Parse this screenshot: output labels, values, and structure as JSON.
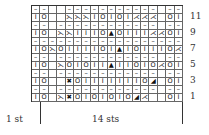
{
  "chart": {
    "columns": 18,
    "rows": [
      {
        "num": "12",
        "cells": [
          "–",
          "–",
          "",
          "",
          "–",
          "–",
          "–",
          "–",
          "–",
          "–",
          "–",
          "–",
          "–",
          "–",
          "–",
          "",
          "–",
          "–"
        ]
      },
      {
        "num": "11",
        "cells": [
          "I",
          "O",
          "",
          "",
          "⋋",
          "⋋",
          "⋋",
          "I",
          "O",
          "I",
          "O",
          "I",
          "⋌",
          "⋌",
          "⋌",
          "",
          "O",
          "I"
        ]
      },
      {
        "num": "10",
        "cells": [
          "–",
          "–",
          "",
          "–",
          "–",
          "–",
          "–",
          "–",
          "–",
          "–",
          "–",
          "–",
          "–",
          "–",
          "–",
          "",
          "–",
          "–"
        ]
      },
      {
        "num": "9",
        "cells": [
          "I",
          "O",
          "",
          "⋋",
          "⋋",
          "I",
          "I",
          "I",
          "O",
          "▲",
          "O",
          "I",
          "I",
          "I",
          "⋌",
          "⋌",
          "O",
          "I"
        ]
      },
      {
        "num": "8",
        "cells": [
          "–",
          "–",
          "–",
          "–",
          "–",
          "–",
          "–",
          "–",
          "–",
          "–",
          "–",
          "–",
          "–",
          "–",
          "–",
          "–",
          "–",
          "–"
        ]
      },
      {
        "num": "7",
        "cells": [
          "I",
          "O",
          "⋋",
          "O",
          "I",
          "I",
          "I",
          "I",
          "O",
          "I",
          "▲",
          "I",
          "O",
          "I",
          "I",
          "I",
          "O",
          "⋌"
        ]
      },
      {
        "num": "6",
        "cells": [
          "–",
          "–",
          "",
          "–",
          "–",
          "–",
          "–",
          "–",
          "–",
          "–",
          "–",
          "–",
          "–",
          "–",
          "–",
          "",
          "–",
          "–"
        ]
      },
      {
        "num": "5",
        "cells": [
          "I",
          "O",
          "",
          "⋋",
          "O",
          "I",
          "O",
          "I",
          "I",
          "▲",
          "I",
          "I",
          "O",
          "I",
          "O",
          "⋌",
          "O",
          "I"
        ]
      },
      {
        "num": "4",
        "cells": [
          "–",
          "–",
          "",
          "–",
          "–",
          "–",
          "–",
          "–",
          "–",
          "–",
          "–",
          "–",
          "–",
          "–",
          "–",
          "",
          "–",
          "–"
        ]
      },
      {
        "num": "3",
        "cells": [
          "I",
          "O",
          "",
          "",
          "✖",
          "O",
          "I",
          "I",
          "I",
          "I",
          "I",
          "I",
          "I",
          "O",
          "◢",
          "",
          "O",
          "I"
        ]
      },
      {
        "num": "2",
        "cells": [
          "–",
          "–",
          "",
          "–",
          "–",
          "–",
          "–",
          "–",
          "–",
          "–",
          "–",
          "–",
          "–",
          "–",
          "–",
          "",
          "–",
          "–"
        ]
      },
      {
        "num": "1",
        "cells": [
          "I",
          "O",
          "",
          "⋋",
          "✖",
          "O",
          "I",
          "O",
          "I",
          "O",
          "I",
          "O",
          "◢",
          "⋌",
          "",
          "",
          "O",
          "I"
        ]
      }
    ],
    "row_labels": [
      "11",
      "9",
      "7",
      "5",
      "3",
      "1"
    ],
    "edge_label": "1 st",
    "repeat_label": "14 sts"
  }
}
